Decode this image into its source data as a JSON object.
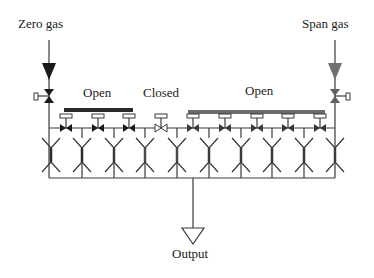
{
  "diagram": {
    "labels": {
      "zero_gas": "Zero gas",
      "span_gas": "Span gas",
      "open_left": "Open",
      "closed": "Closed",
      "open_right": "Open",
      "output": "Output"
    },
    "colors": {
      "pipe": "#3a3a3a",
      "zero_gas_arrow": "#1a1a1a",
      "span_gas_arrow": "#707070",
      "left_actuator_bar": "#2a2a2a",
      "right_actuator_bar": "#6a6a6a",
      "open_valve": "#1a1a1a",
      "closed_valve": "#ffffff"
    },
    "columns_x": [
      51,
      82,
      114,
      145,
      177,
      209,
      241,
      272,
      304,
      335
    ],
    "valves": [
      {
        "x": 66,
        "state": "open",
        "group": "left"
      },
      {
        "x": 98,
        "state": "open",
        "group": "left"
      },
      {
        "x": 129,
        "state": "open",
        "group": "left"
      },
      {
        "x": 161,
        "state": "closed",
        "group": "none"
      },
      {
        "x": 193,
        "state": "open",
        "group": "right"
      },
      {
        "x": 225,
        "state": "open",
        "group": "right"
      },
      {
        "x": 257,
        "state": "open",
        "group": "right"
      },
      {
        "x": 288,
        "state": "open",
        "group": "right"
      },
      {
        "x": 320,
        "state": "open",
        "group": "right"
      }
    ]
  }
}
